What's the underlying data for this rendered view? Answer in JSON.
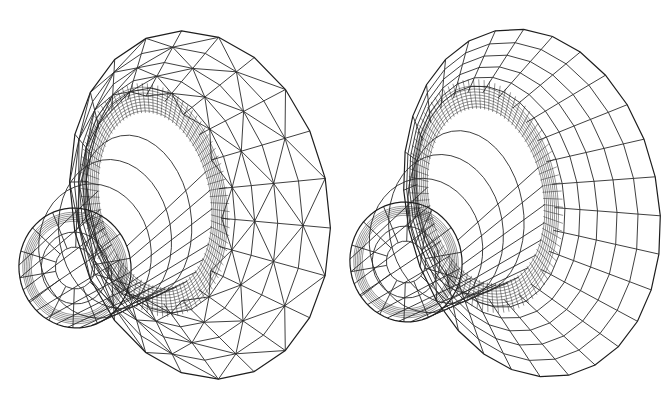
{
  "figure": {
    "panels": [
      {
        "id": "left",
        "caption": "",
        "mesh_type": "triangular",
        "stroke_color": "#2a2a2a",
        "background": "#ffffff",
        "flange": {
          "cx": 200,
          "cy": 205,
          "rx": 128,
          "ry": 176,
          "rot": -12
        },
        "tube_opening": {
          "cx": 75,
          "cy": 268,
          "rx": 56,
          "ry": 60,
          "rot": -10
        },
        "inner_ring": {
          "cx": 155,
          "cy": 200,
          "rx": 62,
          "ry": 100,
          "rot": -10
        },
        "spoke_count": 22,
        "ring_count": 5,
        "dense_ring_count": 9
      },
      {
        "id": "right",
        "caption": "",
        "mesh_type": "quad-dominant",
        "stroke_color": "#2a2a2a",
        "background": "#ffffff",
        "flange": {
          "cx": 196,
          "cy": 203,
          "rx": 126,
          "ry": 176,
          "rot": -12
        },
        "tube_opening": {
          "cx": 70,
          "cy": 262,
          "rx": 56,
          "ry": 60,
          "rot": -10
        },
        "inner_ring": {
          "cx": 150,
          "cy": 196,
          "rx": 64,
          "ry": 100,
          "rot": -10
        },
        "spoke_count": 28,
        "ring_count": 6,
        "dense_ring_count": 8
      }
    ]
  }
}
